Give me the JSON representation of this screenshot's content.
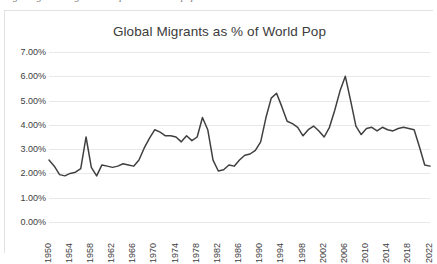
{
  "clipped_caption_text": "Figure: global migrants compared to world population",
  "chart": {
    "title": "Global Migrants as % of World Pop",
    "line_color": "#404040",
    "gridline_color": "#e8e8e8",
    "text_color": "#404040",
    "background": "#ffffff"
  },
  "chart_data": {
    "type": "line",
    "title": "Global Migrants as % of World Pop",
    "xlabel": "",
    "ylabel": "",
    "ylim": [
      0,
      7
    ],
    "xlim": [
      1950,
      2022
    ],
    "grid": true,
    "legend": "none",
    "y_tick_labels": [
      "0.00%",
      "1.00%",
      "2.00%",
      "3.00%",
      "4.00%",
      "5.00%",
      "6.00%",
      "7.00%"
    ],
    "y_tick_values": [
      0,
      1,
      2,
      3,
      4,
      5,
      6,
      7
    ],
    "x_tick_labels": [
      "1950",
      "1954",
      "1958",
      "1962",
      "1966",
      "1970",
      "1974",
      "1978",
      "1982",
      "1986",
      "1990",
      "1994",
      "1998",
      "2002",
      "2006",
      "2010",
      "2014",
      "2018",
      "2022"
    ],
    "x_tick_values": [
      1950,
      1954,
      1958,
      1962,
      1966,
      1970,
      1974,
      1978,
      1982,
      1986,
      1990,
      1994,
      1998,
      2002,
      2006,
      2010,
      2014,
      2018,
      2022
    ],
    "series": [
      {
        "name": "Global Migrants as % of World Pop",
        "x": [
          1950,
          1951,
          1952,
          1953,
          1954,
          1955,
          1956,
          1957,
          1958,
          1959,
          1960,
          1961,
          1962,
          1963,
          1964,
          1965,
          1966,
          1967,
          1968,
          1969,
          1970,
          1971,
          1972,
          1973,
          1974,
          1975,
          1976,
          1977,
          1978,
          1979,
          1980,
          1981,
          1982,
          1983,
          1984,
          1985,
          1986,
          1987,
          1988,
          1989,
          1990,
          1991,
          1992,
          1993,
          1994,
          1995,
          1996,
          1997,
          1998,
          1999,
          2000,
          2001,
          2002,
          2003,
          2004,
          2005,
          2006,
          2007,
          2008,
          2009,
          2010,
          2011,
          2012,
          2013,
          2014,
          2015,
          2016,
          2017,
          2018,
          2019,
          2020,
          2021,
          2022
        ],
        "values": [
          2.55,
          2.3,
          1.95,
          1.9,
          2.0,
          2.05,
          2.2,
          3.5,
          2.25,
          1.9,
          2.35,
          2.3,
          2.25,
          2.3,
          2.4,
          2.35,
          2.3,
          2.55,
          3.05,
          3.45,
          3.8,
          3.7,
          3.55,
          3.55,
          3.5,
          3.3,
          3.55,
          3.35,
          3.5,
          4.3,
          3.8,
          2.55,
          2.1,
          2.15,
          2.35,
          2.3,
          2.55,
          2.75,
          2.8,
          2.95,
          3.3,
          4.3,
          5.1,
          5.3,
          4.75,
          4.15,
          4.05,
          3.9,
          3.55,
          3.8,
          3.95,
          3.75,
          3.5,
          3.9,
          4.6,
          5.4,
          6.0,
          5.0,
          3.95,
          3.6,
          3.85,
          3.9,
          3.75,
          3.9,
          3.8,
          3.75,
          3.85,
          3.9,
          3.85,
          3.8,
          3.1,
          2.35,
          2.3
        ]
      }
    ]
  }
}
